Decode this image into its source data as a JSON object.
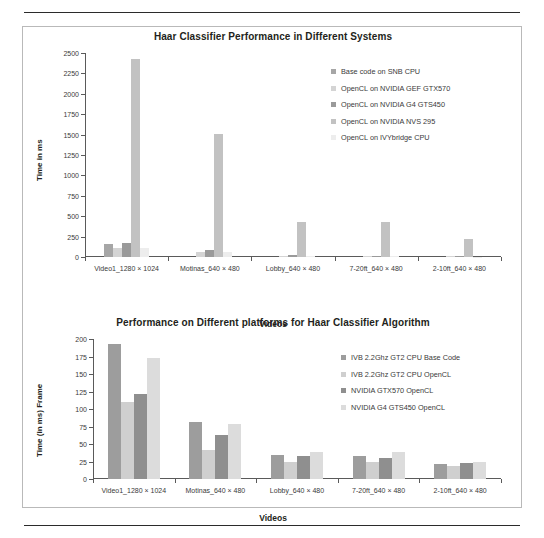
{
  "page": {
    "background": "#ffffff",
    "rule_color": "#2b2b2b",
    "frame_color": "#b9b9b9"
  },
  "chart_data": [
    {
      "id": "chart1",
      "type": "bar",
      "title": "Haar Classifier Performance in Different Systems",
      "xlabel": "Videos",
      "ylabel": "Time in ms",
      "ylim": [
        0,
        2500
      ],
      "yticks": [
        0,
        250,
        500,
        750,
        1000,
        1250,
        1500,
        1750,
        2000,
        2250,
        2500
      ],
      "grid": false,
      "legend_position": "right",
      "categories": [
        "Video1_1280 × 1024",
        "Motinas_640 × 480",
        "Lobby_640 × 480",
        "7-20ft_640 × 480",
        "2-10ft_640 × 480"
      ],
      "series": [
        {
          "name": "Base code on SNB CPU",
          "color": "#a6a6a6",
          "values": [
            165,
            0,
            0,
            0,
            0
          ]
        },
        {
          "name": "OpenCL on NVIDIA GEF GTX570",
          "color": "#d4d4d4",
          "values": [
            105,
            62,
            12,
            10,
            8
          ]
        },
        {
          "name": "OpenCL on NVIDIA G4 GTS450",
          "color": "#9a9a9a",
          "values": [
            170,
            80,
            22,
            18,
            14
          ]
        },
        {
          "name": "OpenCL on NVIDIA NVS 295",
          "color": "#c2c2c2",
          "values": [
            2430,
            1510,
            430,
            430,
            225
          ]
        },
        {
          "name": "OpenCL on IVYbridge CPU",
          "color": "#ededed",
          "values": [
            110,
            60,
            10,
            8,
            6
          ]
        }
      ]
    },
    {
      "id": "chart2",
      "type": "bar",
      "title": "Performance on Different platforms for Haar Classifier Algorithm",
      "xlabel": "Videos",
      "ylabel": "Time (in ms) Frame",
      "ylim": [
        0,
        200
      ],
      "yticks": [
        0,
        25,
        50,
        75,
        100,
        125,
        150,
        175,
        200
      ],
      "grid": false,
      "legend_position": "right",
      "categories": [
        "Video1_1280 × 1024",
        "Motinas_640 × 480",
        "Lobby_640 × 480",
        "7-20ft_640 × 480",
        "2-10ft_640 × 480"
      ],
      "series": [
        {
          "name": "IVB 2.2Ghz GT2 CPU Base Code",
          "color": "#9d9d9d",
          "values": [
            193,
            82,
            35,
            33,
            21
          ]
        },
        {
          "name": "IVB 2.2Ghz GT2 CPU OpenCL",
          "color": "#cfcfcf",
          "values": [
            110,
            42,
            25,
            25,
            19
          ]
        },
        {
          "name": "NVIDIA GTX570 OpenCL",
          "color": "#8f8f8f",
          "values": [
            121,
            63,
            33,
            30,
            23
          ]
        },
        {
          "name": "NVIDIA G4 GTS450 OpenCL",
          "color": "#dcdcdc",
          "values": [
            173,
            79,
            38,
            38,
            25
          ]
        }
      ]
    }
  ]
}
